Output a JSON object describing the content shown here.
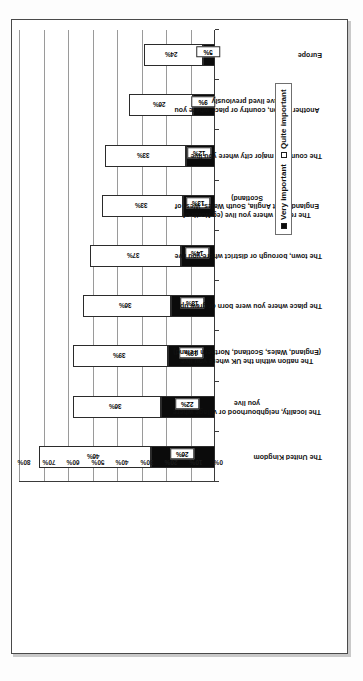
{
  "chart_data": {
    "type": "bar",
    "subtype": "stacked-bar",
    "title": "",
    "xlabel": "",
    "ylabel": "",
    "ylim": [
      0,
      80
    ],
    "ytick_labels": [
      "0%",
      "10%",
      "20%",
      "30%",
      "40%",
      "50%",
      "60%",
      "70%",
      "80%"
    ],
    "ytick_values": [
      0,
      10,
      20,
      30,
      40,
      50,
      60,
      70,
      80
    ],
    "grid": true,
    "legend_position": "right",
    "categories": [
      "The United Kingdom",
      "The locality, neighbourhood or village where you live",
      "The nation within the UK where you live (England, Wales, Scotland, Northern Ireland)",
      "The place where you were born or grew up",
      "The town, borough or district where you live",
      "The region where you live (eg North of England, East Anglia, South Wales, West of Scotland)",
      "The county or major city where you live",
      "Another region, country or place where you have lived previously",
      "Europe"
    ],
    "series": [
      {
        "name": "Very important",
        "color": "#0b0b0b",
        "values": [
          26,
          22,
          19,
          18,
          14,
          13,
          12,
          9,
          5
        ],
        "labels": [
          "26%",
          "22%",
          "19%",
          "18%",
          "14%",
          "13%",
          "12%",
          "9%",
          "5%"
        ]
      },
      {
        "name": "Quite important",
        "color": "#ffffff",
        "values": [
          46,
          36,
          39,
          36,
          37,
          33,
          33,
          26,
          24
        ],
        "labels": [
          "46%",
          "36%",
          "39%",
          "36%",
          "37%",
          "33%",
          "33%",
          "26%",
          "24%"
        ]
      }
    ],
    "totals": [
      72,
      58,
      58,
      54,
      51,
      46,
      45,
      35,
      29
    ]
  },
  "legend": {
    "items": [
      {
        "label": "Very important",
        "swatch": "filled-square-icon"
      },
      {
        "label": "Quite important",
        "swatch": "empty-square-icon"
      }
    ]
  }
}
